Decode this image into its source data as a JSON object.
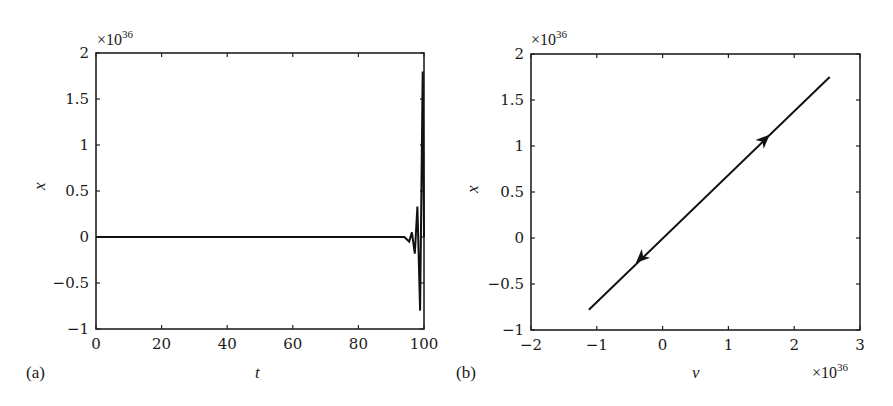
{
  "chart_data": [
    {
      "panel": "(a)",
      "type": "line",
      "title": "",
      "xlabel": "t",
      "ylabel": "x",
      "xlim": [
        0,
        100
      ],
      "ylim": [
        -1,
        2
      ],
      "y_multiplier": "×10^36",
      "xticks": [
        0,
        20,
        40,
        60,
        80,
        100
      ],
      "xtick_labels": [
        "0",
        "20",
        "40",
        "60",
        "80",
        "100"
      ],
      "yticks": [
        -1,
        -0.5,
        0,
        0.5,
        1,
        1.5,
        2
      ],
      "ytick_labels": [
        "−1",
        "−0.5",
        "0",
        "0.5",
        "1",
        "1.5",
        "2"
      ],
      "grid": false,
      "series": [
        {
          "name": "x(t)",
          "x": [
            0,
            20,
            40,
            60,
            80,
            94,
            95.5,
            96.3,
            97.2,
            98.0,
            98.8,
            99.6,
            100
          ],
          "y": [
            0,
            0,
            0,
            0,
            0,
            0,
            -0.05,
            0.05,
            -0.18,
            0.33,
            -0.8,
            1.8,
            0
          ]
        }
      ]
    },
    {
      "panel": "(b)",
      "type": "line",
      "title": "",
      "xlabel": "ν",
      "ylabel": "x",
      "xlim": [
        -2,
        3
      ],
      "ylim": [
        -1,
        2
      ],
      "x_multiplier": "×10^36",
      "y_multiplier": "×10^36",
      "xticks": [
        -2,
        -1,
        0,
        1,
        2,
        3
      ],
      "xtick_labels": [
        "−2",
        "−1",
        "0",
        "1",
        "2",
        "3"
      ],
      "yticks": [
        -1,
        -0.5,
        0,
        0.5,
        1,
        1.5,
        2
      ],
      "ytick_labels": [
        "−1",
        "−0.5",
        "0",
        "0.5",
        "1",
        "1.5",
        "2"
      ],
      "grid": false,
      "series": [
        {
          "name": "phase trajectory",
          "x": [
            -1.12,
            2.54
          ],
          "y": [
            -0.78,
            1.75
          ]
        }
      ],
      "annotations": [
        {
          "type": "arrow",
          "at": [
            1.55,
            1.07
          ],
          "direction": "up-right"
        },
        {
          "type": "arrow",
          "at": [
            -0.33,
            -0.22
          ],
          "direction": "down-left"
        }
      ]
    }
  ],
  "labels": {
    "panel_a": "(a)",
    "panel_b": "(b)",
    "a_xlabel": "t",
    "a_ylabel": "x",
    "b_xlabel": "ν",
    "b_ylabel": "x",
    "mult_base": "×10",
    "mult_exp": "36"
  }
}
